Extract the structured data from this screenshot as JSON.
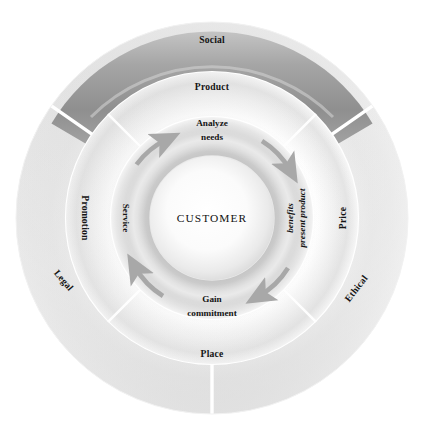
{
  "diagram": {
    "center": {
      "x": 212,
      "y": 218
    },
    "core": {
      "label": "CUSTOMER",
      "radius": 62,
      "fill_center": "#ffffff",
      "fill_edge": "#d9d9d9"
    },
    "rings": [
      {
        "name": "sales-cycle-ring",
        "inner_radius": 62,
        "outer_radius": 101,
        "fill": "#cfcfcf",
        "segments": [
          {
            "label": "Analyze needs",
            "angle_deg": -90,
            "style": "upright",
            "lines": [
              "Analyze",
              "needs"
            ]
          },
          {
            "label": "present product benefits",
            "angle_deg": 0,
            "style": "radial",
            "lines": [
              "present product",
              "benefits"
            ]
          },
          {
            "label": "Gain commitment",
            "angle_deg": 90,
            "style": "upright",
            "lines": [
              "Gain",
              "commitment"
            ]
          },
          {
            "label": "Service",
            "angle_deg": 180,
            "style": "radial",
            "lines": [
              "Service"
            ]
          }
        ],
        "arrows": {
          "direction": "clockwise",
          "count": 4,
          "color": "#a8a8a8",
          "positions_deg": [
            -135,
            -45,
            45,
            135
          ]
        }
      },
      {
        "name": "marketing-mix-ring",
        "inner_radius": 101,
        "outer_radius": 146,
        "fill": "#ededed",
        "segments": [
          {
            "label": "Product",
            "angle_deg": -90,
            "style": "upright"
          },
          {
            "label": "Price",
            "angle_deg": 0,
            "style": "radial"
          },
          {
            "label": "Place",
            "angle_deg": 90,
            "style": "upright"
          },
          {
            "label": "Promotion",
            "angle_deg": 180,
            "style": "radial"
          }
        ],
        "separators_deg": [
          -45,
          45,
          135,
          -135
        ]
      },
      {
        "name": "environment-ring",
        "inner_radius": 146,
        "outer_radius": 196,
        "fill": "#e4e4e4",
        "segments": [
          {
            "label": "Social",
            "angle_deg": -90,
            "style": "upright",
            "fill": "#a2a2a2",
            "shade": "dark"
          },
          {
            "label": "Ethical",
            "angle_deg": 38,
            "style": "radial",
            "fill": "#f2f2f2",
            "shade": "light"
          },
          {
            "label": "Legal",
            "angle_deg": 142,
            "style": "radial",
            "fill": "#dcdcdc",
            "shade": "light"
          }
        ],
        "separators_deg": [
          -35,
          -145,
          90
        ]
      }
    ],
    "colors": {
      "text": "#141414",
      "arrow": "#a8a8a8",
      "ring_outer_dark": "#a2a2a2",
      "ring_outer_light": "#f1f1f1",
      "ring_mid": "#ededed",
      "ring_inner": "#cfcfcf",
      "background": "#ffffff",
      "separator": "#ffffff"
    }
  }
}
